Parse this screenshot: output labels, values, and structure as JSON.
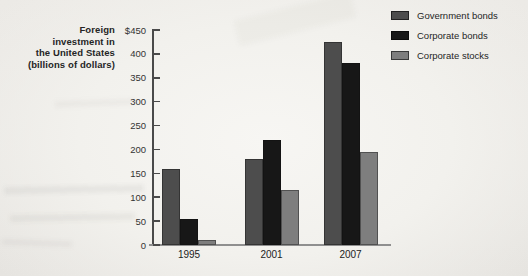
{
  "chart_data": {
    "type": "bar",
    "title": "Foreign investment in the United States (billions of dollars)",
    "ylabel_lines": [
      "Foreign",
      "investment in",
      "the United States",
      "(billions of dollars)"
    ],
    "categories": [
      "1995",
      "2001",
      "2007"
    ],
    "series": [
      {
        "name": "Government bonds",
        "color": "#4d4d4d",
        "values": [
          160,
          180,
          425
        ]
      },
      {
        "name": "Corporate bonds",
        "color": "#171717",
        "values": [
          55,
          220,
          380
        ]
      },
      {
        "name": "Corporate stocks",
        "color": "#7e7e7e",
        "values": [
          10,
          115,
          195
        ]
      }
    ],
    "y_ticks": [
      {
        "label": "$450",
        "value": 450
      },
      {
        "label": "400",
        "value": 400
      },
      {
        "label": "350",
        "value": 350
      },
      {
        "label": "300",
        "value": 300
      },
      {
        "label": "250",
        "value": 250
      },
      {
        "label": "200",
        "value": 200
      },
      {
        "label": "150",
        "value": 150
      },
      {
        "label": "100",
        "value": 100
      },
      {
        "label": "50",
        "value": 50
      },
      {
        "label": "0",
        "value": 0
      }
    ],
    "ylim": [
      0,
      450
    ],
    "grid": false,
    "legend_position": "top-right"
  }
}
